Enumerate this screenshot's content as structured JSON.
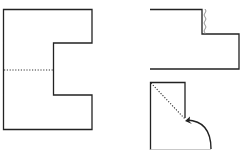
{
  "diagram": {
    "colors": {
      "stroke": "#222222",
      "dotted": "#333333",
      "squiggle": "#888888",
      "faint": "#bbbbbb",
      "background": "#ffffff"
    },
    "figures": [
      {
        "id": "figure-c-shape",
        "label": "C-shaped sheet with horizontal dotted fold line"
      },
      {
        "id": "figure-folded-l-shape",
        "label": "Folded L-shaped sheet with wavy crease"
      },
      {
        "id": "figure-diagonal-fold",
        "label": "Rectangle with dotted diagonal fold and curved arrow"
      }
    ]
  }
}
